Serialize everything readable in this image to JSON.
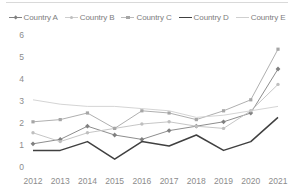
{
  "chart_data": {
    "type": "line",
    "title": "",
    "xlabel": "",
    "ylabel": "",
    "categories": [
      "2012",
      "2013",
      "2014",
      "2015",
      "2016",
      "2017",
      "2018",
      "2019",
      "2020",
      "2021"
    ],
    "yticks": [
      0,
      1,
      2,
      3,
      4,
      5,
      6
    ],
    "ylim": [
      0,
      6
    ],
    "grid": false,
    "legend_position": "top-center",
    "series": [
      {
        "name": "Country A",
        "color": "#808080",
        "marker": "diamond",
        "values": [
          1.1,
          1.3,
          1.9,
          1.5,
          1.3,
          1.7,
          1.9,
          2.1,
          2.5,
          4.5
        ]
      },
      {
        "name": "Country B",
        "color": "#bfbfbf",
        "marker": "dot",
        "values": [
          1.6,
          1.2,
          1.6,
          1.8,
          2.0,
          2.1,
          1.9,
          1.8,
          2.6,
          3.8
        ]
      },
      {
        "name": "Country C",
        "color": "#a6a6a6",
        "marker": "plus",
        "values": [
          2.1,
          2.2,
          2.5,
          1.8,
          2.6,
          2.5,
          2.2,
          2.6,
          3.1,
          5.4
        ]
      },
      {
        "name": "Country D",
        "color": "#404040",
        "marker": "none",
        "values": [
          0.8,
          0.8,
          1.2,
          0.4,
          1.2,
          1.0,
          1.5,
          0.8,
          1.2,
          2.3
        ]
      },
      {
        "name": "Country E",
        "color": "#cfcfcf",
        "marker": "none",
        "values": [
          3.1,
          2.9,
          2.8,
          2.8,
          2.7,
          2.6,
          2.3,
          2.4,
          2.6,
          2.8
        ]
      }
    ]
  }
}
